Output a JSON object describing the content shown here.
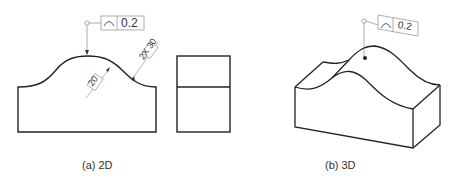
{
  "figure": {
    "panel_a": {
      "caption": "(a) 2D",
      "tolerance": {
        "symbol": "⌒",
        "symbol_name": "profile-of-a-line",
        "value": "0.2"
      },
      "dimensions": {
        "radius_small": "20",
        "radius_large": "2X 30"
      }
    },
    "panel_b": {
      "caption": "(b) 3D",
      "tolerance": {
        "symbol": "⌒",
        "symbol_name": "profile-of-a-line",
        "value": "0.2"
      }
    }
  },
  "colors": {
    "line": "#222222",
    "leader": "#888888",
    "frame": "#999999"
  }
}
